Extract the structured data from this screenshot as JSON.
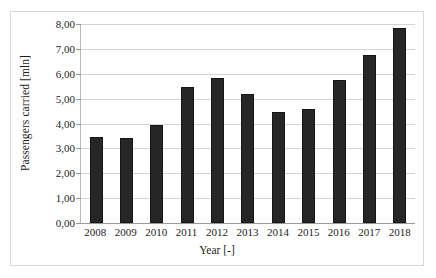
{
  "chart_data": {
    "type": "bar",
    "title": "",
    "subtitle": "",
    "xlabel": "Year [-]",
    "ylabel": "Passengers carried [mln]",
    "categories": [
      "2008",
      "2009",
      "2010",
      "2011",
      "2012",
      "2013",
      "2014",
      "2015",
      "2016",
      "2017",
      "2018"
    ],
    "values": [
      3.45,
      3.42,
      3.95,
      5.45,
      5.82,
      5.2,
      4.47,
      4.6,
      5.74,
      6.76,
      7.83
    ],
    "ylim": [
      0,
      8
    ],
    "ytick_values": [
      0,
      1,
      2,
      3,
      4,
      5,
      6,
      7,
      8
    ],
    "ytick_labels": [
      "0,00",
      "1,00",
      "2,00",
      "3,00",
      "4,00",
      "5,00",
      "6,00",
      "7,00",
      "8,00"
    ],
    "xtick_labels": [
      "2008",
      "2009",
      "2010",
      "2011",
      "2012",
      "2013",
      "2014",
      "2015",
      "2016",
      "2017",
      "2018"
    ],
    "grid": "horizontal",
    "legend": "none",
    "decimal_separator": ",",
    "series": [
      {
        "name": "Passengers carried",
        "values": [
          3.45,
          3.42,
          3.95,
          5.45,
          5.82,
          5.2,
          4.47,
          4.6,
          5.74,
          6.76,
          7.83
        ]
      }
    ],
    "colors": {
      "bar": "#262626",
      "bar_border": "#161616",
      "gridline": "#d4d4d4",
      "axis": "#9a9a9a",
      "frame": "#d8d8d8",
      "background": "#ffffff",
      "text": "#1c1c1c"
    }
  }
}
